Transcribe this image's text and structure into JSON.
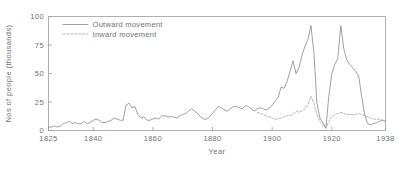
{
  "chart_data": {
    "type": "line",
    "title": "",
    "xlabel": "Year",
    "ylabel": "Nos of people (thousands)",
    "xlim": [
      1825,
      1938
    ],
    "ylim": [
      0,
      100
    ],
    "grid": false,
    "legend_position": "upper-left-inside",
    "xticks": [
      "1825",
      "1840",
      "1860",
      "1880",
      "1900",
      "1920",
      "1938"
    ],
    "xtick_values": [
      1825,
      1840,
      1860,
      1880,
      1900,
      1920,
      1938
    ],
    "yticks": [
      "0",
      "25",
      "50",
      "75",
      "100"
    ],
    "ytick_values": [
      0,
      25,
      50,
      75,
      100
    ],
    "series": [
      {
        "name": "Outward movement",
        "style": "solid",
        "color": "#808080",
        "x": [
          1825,
          1826,
          1827,
          1828,
          1829,
          1830,
          1831,
          1832,
          1833,
          1834,
          1835,
          1836,
          1837,
          1838,
          1839,
          1840,
          1841,
          1842,
          1843,
          1844,
          1845,
          1846,
          1847,
          1848,
          1849,
          1850,
          1851,
          1852,
          1853,
          1854,
          1855,
          1856,
          1857,
          1858,
          1859,
          1860,
          1861,
          1862,
          1863,
          1864,
          1865,
          1866,
          1867,
          1868,
          1869,
          1870,
          1871,
          1872,
          1873,
          1874,
          1875,
          1876,
          1877,
          1878,
          1879,
          1880,
          1881,
          1882,
          1883,
          1884,
          1885,
          1886,
          1887,
          1888,
          1889,
          1890,
          1891,
          1892,
          1893,
          1894,
          1895,
          1896,
          1897,
          1898,
          1899,
          1900,
          1901,
          1902,
          1903,
          1904,
          1905,
          1906,
          1907,
          1908,
          1909,
          1910,
          1911,
          1912,
          1913,
          1914,
          1915,
          1916,
          1917,
          1918,
          1919,
          1920,
          1921,
          1922,
          1923,
          1924,
          1925,
          1926,
          1927,
          1928,
          1929,
          1930,
          1931,
          1932,
          1933,
          1934,
          1935,
          1936,
          1937,
          1938
        ],
        "values": [
          3,
          3,
          4,
          3,
          4,
          6,
          7,
          8,
          6,
          7,
          6,
          6,
          8,
          6,
          7,
          9,
          10,
          9,
          7,
          7,
          8,
          9,
          11,
          10,
          9,
          9,
          22,
          24,
          20,
          21,
          14,
          11,
          12,
          9,
          9,
          10,
          11,
          10,
          13,
          13,
          12,
          12,
          12,
          11,
          13,
          14,
          15,
          17,
          19,
          17,
          15,
          12,
          10,
          10,
          12,
          15,
          18,
          21,
          20,
          18,
          17,
          19,
          21,
          21,
          20,
          19,
          22,
          21,
          19,
          17,
          19,
          20,
          19,
          18,
          20,
          22,
          26,
          29,
          38,
          37,
          43,
          52,
          61,
          50,
          55,
          66,
          74,
          80,
          92,
          68,
          24,
          11,
          7,
          2,
          30,
          50,
          58,
          63,
          92,
          72,
          62,
          58,
          55,
          52,
          48,
          30,
          14,
          6,
          5,
          6,
          7,
          8,
          9,
          8
        ]
      },
      {
        "name": "Inward movement",
        "style": "dashed",
        "color": "#9b9b9b",
        "x": [
          1895,
          1896,
          1897,
          1898,
          1899,
          1900,
          1901,
          1902,
          1903,
          1904,
          1905,
          1906,
          1907,
          1908,
          1909,
          1910,
          1911,
          1912,
          1913,
          1914,
          1915,
          1916,
          1917,
          1918,
          1919,
          1920,
          1921,
          1922,
          1923,
          1924,
          1925,
          1926,
          1927,
          1928,
          1929,
          1930,
          1931,
          1932,
          1933,
          1934,
          1935,
          1936,
          1937,
          1938
        ],
        "values": [
          16,
          15,
          14,
          13,
          12,
          11,
          10,
          10,
          11,
          12,
          13,
          13,
          14,
          17,
          16,
          17,
          19,
          23,
          30,
          24,
          14,
          8,
          5,
          2,
          8,
          12,
          14,
          15,
          16,
          15,
          14,
          14,
          14,
          14,
          15,
          14,
          13,
          12,
          11,
          10,
          10,
          10,
          9,
          9
        ]
      }
    ]
  },
  "legend": {
    "entries": [
      {
        "label": "Outward movement",
        "style": "solid"
      },
      {
        "label": "Inward movement",
        "style": "dashed"
      }
    ]
  }
}
